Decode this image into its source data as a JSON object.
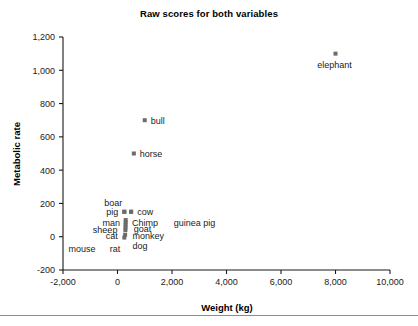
{
  "figure": {
    "title": "Raw scores for both variables",
    "bottom_rule": true
  },
  "chart_data": {
    "type": "scatter",
    "title": "Raw scores for both variables",
    "xlabel": "Weight (kg)",
    "ylabel": "Metabolic rate",
    "xlim": [
      -2000,
      10000
    ],
    "ylim": [
      -200,
      1200
    ],
    "xticks": [
      -2000,
      0,
      2000,
      4000,
      6000,
      8000,
      10000
    ],
    "xtick_labels": [
      "-2,000",
      "0",
      "2,000",
      "4,000",
      "6,000",
      "8,000",
      "10,000"
    ],
    "yticks": [
      -200,
      0,
      200,
      400,
      600,
      800,
      1000,
      1200
    ],
    "ytick_labels": [
      "-200",
      "0",
      "200",
      "400",
      "600",
      "800",
      "1,000",
      "1,200"
    ],
    "grid": false,
    "legend": "none",
    "marker_color": "#6b6b6b",
    "marker_shape": "square",
    "points": [
      {
        "label": "elephant",
        "x": 8000,
        "y": 1100,
        "label_dx": -1,
        "label_dy": 14,
        "anchor": "middle"
      },
      {
        "label": "bull",
        "x": 1000,
        "y": 700,
        "label_dx": 6,
        "label_dy": 3.5,
        "anchor": "start"
      },
      {
        "label": "horse",
        "x": 600,
        "y": 500,
        "label_dx": 6,
        "label_dy": 3.5,
        "anchor": "start"
      },
      {
        "label": "cow",
        "x": 500,
        "y": 150,
        "label_dx": 6,
        "label_dy": 3.5,
        "anchor": "start"
      },
      {
        "label": "pig",
        "x": 250,
        "y": 150,
        "label_dx": -6,
        "label_dy": 3.5,
        "anchor": "end"
      },
      {
        "label": "boar",
        "x": 250,
        "y": 150,
        "label_dx": -2,
        "label_dy": -6,
        "anchor": "end"
      },
      {
        "label": "Chimp",
        "x": 310,
        "y": 85,
        "label_dx": 6,
        "label_dy": 3.5,
        "anchor": "start"
      },
      {
        "label": "man",
        "x": 310,
        "y": 85,
        "label_dx": -6,
        "label_dy": 3.5,
        "anchor": "end"
      },
      {
        "label": "goat",
        "x": 300,
        "y": 55,
        "label_dx": 8,
        "label_dy": 4,
        "anchor": "start"
      },
      {
        "label": "sheep",
        "x": 290,
        "y": 45,
        "label_dx": -8,
        "label_dy": 4,
        "anchor": "end"
      },
      {
        "label": "guinea pig",
        "x": 300,
        "y": 85,
        "label_dx": 48,
        "label_dy": 3.5,
        "anchor": "start"
      },
      {
        "label": "monkey",
        "x": 290,
        "y": 10,
        "label_dx": 7,
        "label_dy": 4,
        "anchor": "start"
      },
      {
        "label": "cat",
        "x": 270,
        "y": 10,
        "label_dx": -7,
        "label_dy": 4,
        "anchor": "end"
      },
      {
        "label": "dog",
        "x": 290,
        "y": 10,
        "label_dx": 7,
        "label_dy": 14,
        "anchor": "start"
      },
      {
        "label": "rat",
        "x": 250,
        "y": 0,
        "label_dx": -4,
        "label_dy": 15,
        "anchor": "end"
      },
      {
        "label": "mouse",
        "x": 150,
        "y": 0,
        "label_dx": -26,
        "label_dy": 15,
        "anchor": "end"
      }
    ],
    "cluster_markers": [
      {
        "x": 250,
        "y": 150
      },
      {
        "x": 500,
        "y": 150
      },
      {
        "x": 300,
        "y": 100
      },
      {
        "x": 300,
        "y": 85
      },
      {
        "x": 295,
        "y": 70
      },
      {
        "x": 295,
        "y": 55
      },
      {
        "x": 290,
        "y": 40
      },
      {
        "x": 280,
        "y": 12
      },
      {
        "x": 250,
        "y": -5
      }
    ]
  }
}
